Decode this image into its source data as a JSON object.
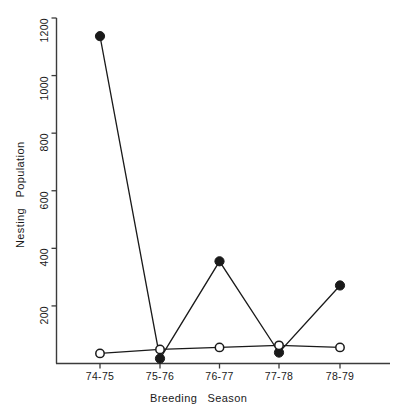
{
  "chart_data": {
    "type": "line",
    "title": "",
    "xlabel": "Breeding   Season",
    "ylabel": "Nesting   Population",
    "categories": [
      "74-75",
      "75-76",
      "76-77",
      "77-78",
      "78-79"
    ],
    "ylim": [
      0,
      1200
    ],
    "yticks": [
      200,
      400,
      600,
      800,
      1000,
      1200
    ],
    "ytick_labels": [
      "200",
      "400",
      "600",
      "800",
      "1000",
      "1200"
    ],
    "grid": false,
    "legend": "none",
    "series": [
      {
        "name": "filled-circle-series",
        "marker": "filled-circle",
        "color": "#1a1a1a",
        "values": [
          1137,
          17,
          355,
          38,
          271
        ]
      },
      {
        "name": "open-circle-series",
        "marker": "open-circle",
        "color": "#1a1a1a",
        "values": [
          35,
          49,
          56,
          63,
          56
        ]
      }
    ]
  },
  "axes": {
    "y_axis_name": "nesting-population-axis",
    "x_axis_name": "breeding-season-axis"
  }
}
